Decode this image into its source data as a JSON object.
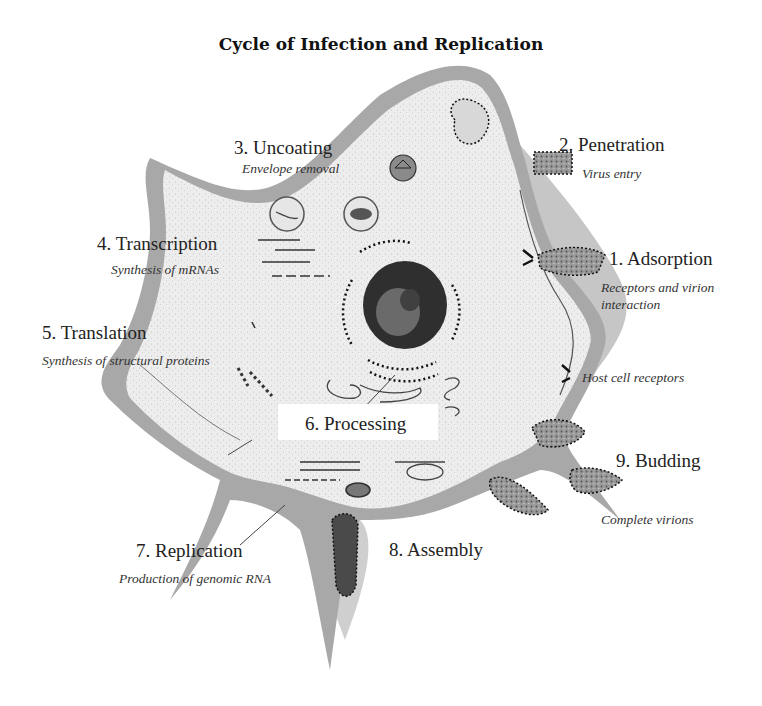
{
  "title": "Cycle of Infection and Replication",
  "colors": {
    "background": "#ffffff",
    "cytoplasm": "#ececec",
    "membrane": "#9a9a9a",
    "extracellular_shade": "#c8c8c8",
    "nucleus": "#3a3a3a",
    "text": "#222222"
  },
  "steps": [
    {
      "number": "1",
      "label": "1. Adsorption",
      "description": "Receptors and virion interaction",
      "description_lines": [
        "Receptors and virion",
        "interaction"
      ]
    },
    {
      "number": "2",
      "label": "2. Penetration",
      "description": "Virus entry"
    },
    {
      "number": "3",
      "label": "3. Uncoating",
      "description": "Envelope removal"
    },
    {
      "number": "4",
      "label": "4. Transcription",
      "description": "Synthesis of mRNAs"
    },
    {
      "number": "5",
      "label": "5. Translation",
      "description": "Synthesis of structural proteins"
    },
    {
      "number": "6",
      "label": "6. Processing",
      "description": ""
    },
    {
      "number": "7",
      "label": "7. Replication",
      "description": "Production of genomic RNA"
    },
    {
      "number": "8",
      "label": "8. Assembly",
      "description": ""
    },
    {
      "number": "9",
      "label": "9. Budding",
      "description": "Complete virions"
    }
  ],
  "annotations": {
    "host_cell_receptors": "Host cell receptors"
  },
  "structures": [
    "host-cell",
    "nucleus",
    "endoplasmic-reticulum",
    "golgi",
    "virions",
    "endosomes",
    "mRNA-strands"
  ]
}
